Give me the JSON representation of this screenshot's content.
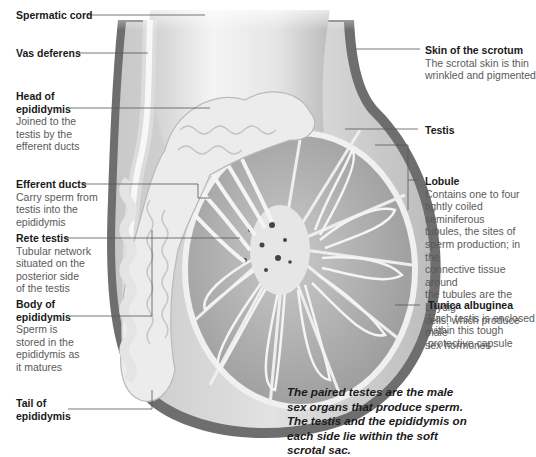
{
  "diagram": {
    "labels_left": [
      {
        "id": "spermatic-cord",
        "title": "Spermatic cord",
        "desc": ""
      },
      {
        "id": "vas-deferens",
        "title": "Vas deferens",
        "desc": ""
      },
      {
        "id": "head-epididymis",
        "title": "Head of epididymis",
        "title_lines": [
          "Head of",
          "epididymis"
        ],
        "desc_lines": [
          "Joined to the",
          "testis by the",
          "efferent ducts"
        ]
      },
      {
        "id": "efferent-ducts",
        "title": "Efferent ducts",
        "desc_lines": [
          "Carry sperm from",
          "testis into the",
          "epididymis"
        ]
      },
      {
        "id": "rete-testis",
        "title": "Rete testis",
        "desc_lines": [
          "Tubular network",
          "situated on the",
          "posterior side",
          "of the testis"
        ]
      },
      {
        "id": "body-epididymis",
        "title": "Body of epididymis",
        "title_lines": [
          "Body of",
          "epididymis"
        ],
        "desc_lines": [
          "Sperm is",
          "stored in the",
          "epididymis as",
          "it matures"
        ]
      },
      {
        "id": "tail-epididymis",
        "title": "Tail of epididymis",
        "title_lines": [
          "Tail of",
          "epididymis"
        ],
        "desc_lines": []
      }
    ],
    "labels_right": [
      {
        "id": "skin-scrotum",
        "title": "Skin of the scrotum",
        "desc_lines": [
          "The scrotal skin is thin",
          "wrinkled and pigmented"
        ]
      },
      {
        "id": "testis",
        "title": "Testis",
        "desc_lines": []
      },
      {
        "id": "lobule",
        "title": "Lobule",
        "desc_lines": [
          "Contains one to four",
          "tightly coiled seminiferous",
          "tubules, the sites of",
          "sperm production; in the",
          "connective tissue around",
          "the tubules are the Leydig",
          "cells, which produce male",
          "sex hormones"
        ]
      },
      {
        "id": "tunica-albuginea",
        "title": "Tunica albuginea",
        "desc_lines": [
          "Each testis is enclosed",
          "within this tough",
          "protective capsule"
        ]
      }
    ],
    "caption_lines": [
      "The paired testes are the male",
      "sex organs that produce sperm.",
      "The testis and the epididymis on",
      "each side lie within the soft",
      "scrotal sac."
    ],
    "colors": {
      "background": "#ffffff",
      "skin_dark": "#6e6e6e",
      "tissue_mid": "#a9a9a9",
      "tissue_light": "#d4d4d4",
      "tubule_white": "#f2f2f2",
      "leader_line": "#555555",
      "title_text": "#1a1a1a",
      "desc_text": "#5a5a5a"
    }
  }
}
